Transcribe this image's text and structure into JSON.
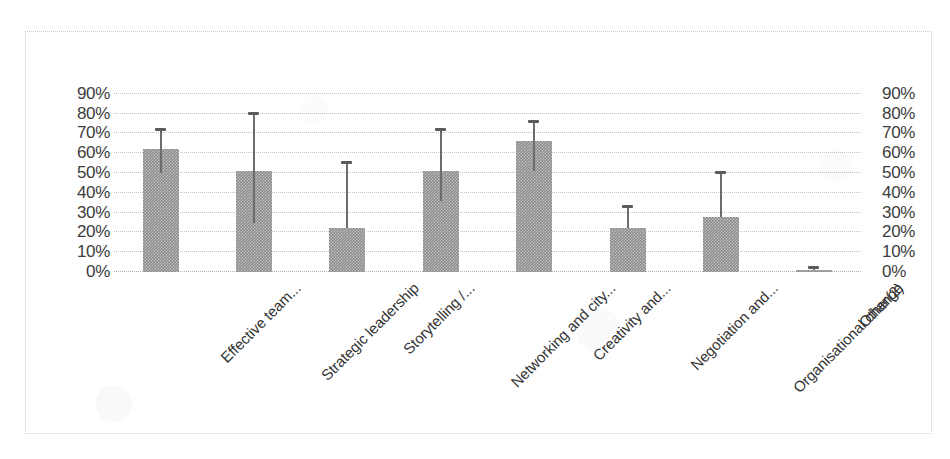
{
  "chart_data": {
    "type": "bar",
    "title": "",
    "subtitle": "",
    "xlabel": "",
    "ylabel": "",
    "ylim": [
      0,
      95
    ],
    "grid": true,
    "legend": false,
    "legend_position": "none",
    "orientation": "vertical",
    "dual_y_axis": true,
    "value_format": "percent",
    "bar_color": "#8c8c8c",
    "error_bar_color": "#6d6d6d",
    "gridline_color": "#c4c4c4",
    "frame_color": "#c9c9c9",
    "background_color": "#ffffff",
    "categories": [
      "Effective team...",
      "Strategic leadership",
      "Storytelling /...",
      "Networking and city...",
      "Creativity and...",
      "Negotiation and...",
      "Organisational change",
      "Other(2)"
    ],
    "values": [
      62,
      51,
      22,
      51,
      66,
      22,
      28,
      1
    ],
    "error_upper": [
      72,
      80,
      55,
      72,
      76,
      33,
      50,
      2
    ],
    "error_lower": [
      50,
      25,
      22,
      36,
      51,
      22,
      28,
      1
    ],
    "series": [
      {
        "name": "Response rate",
        "values": [
          62,
          51,
          22,
          51,
          66,
          22,
          28,
          1
        ]
      }
    ],
    "y_ticks": [
      0,
      10,
      20,
      30,
      40,
      50,
      60,
      70,
      80,
      90
    ],
    "y_tick_labels_left": [
      "0%",
      "10%",
      "20%",
      "30%",
      "40%",
      "50%",
      "60%",
      "70%",
      "80%",
      "90%"
    ],
    "y_tick_labels_right": [
      "0%",
      "10%",
      "20%",
      "30%",
      "40%",
      "50%",
      "60%",
      "70%",
      "80%",
      "90%"
    ]
  }
}
